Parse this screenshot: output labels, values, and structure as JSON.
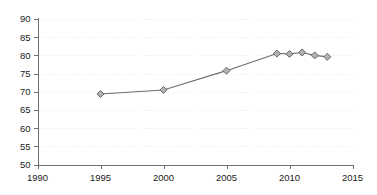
{
  "chart_data": {
    "type": "line",
    "title": "",
    "subtitle": "",
    "xlabel": "",
    "ylabel": "",
    "xlim": [
      1990,
      2015
    ],
    "ylim": [
      50,
      90
    ],
    "x_ticks": [
      1990,
      1995,
      2000,
      2005,
      2010,
      2015
    ],
    "x_tick_labels": [
      "1990",
      "1995",
      "2000",
      "2005",
      "2010",
      "2015"
    ],
    "y_ticks": [
      50,
      55,
      60,
      65,
      70,
      75,
      80,
      85,
      90
    ],
    "y_tick_labels": [
      "50",
      "55",
      "60",
      "65",
      "70",
      "75",
      "80",
      "85",
      "90"
    ],
    "grid": "horizontal-dotted",
    "legend": "none",
    "marker": "diamond",
    "series": [
      {
        "name": "series-1",
        "x": [
          1995,
          2000,
          2005,
          2009,
          2010,
          2011,
          2012,
          2013
        ],
        "values": [
          69.4,
          70.5,
          75.8,
          80.5,
          80.4,
          80.8,
          80.0,
          79.6
        ]
      }
    ]
  },
  "colors": {
    "line": "#6d6d6d",
    "marker_fill": "#b3b3b3",
    "marker_edge": "#5a5a5a",
    "axis": "#6f6f6f",
    "grid": "#ededf2",
    "text": "#1a1a1a",
    "background": "#ffffff"
  }
}
